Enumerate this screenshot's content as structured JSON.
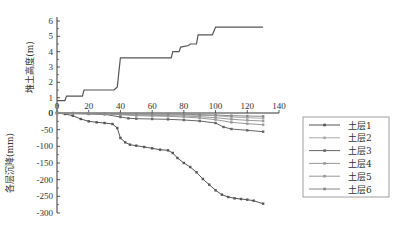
{
  "chart_data": [
    {
      "type": "line",
      "title": "",
      "xlabel": "",
      "ylabel": "堆土高度(m)",
      "xlim": [
        0,
        140
      ],
      "ylim": [
        0,
        6
      ],
      "xticks": [
        0,
        20,
        40,
        60,
        80,
        100,
        120,
        140
      ],
      "yticks": [
        0,
        1,
        2,
        3,
        4,
        5,
        6
      ],
      "series": [
        {
          "name": "堆土高度",
          "x": [
            0,
            5,
            6,
            16,
            17,
            36,
            38,
            40,
            72,
            73,
            77,
            78,
            83,
            84,
            88,
            89,
            98,
            100,
            130
          ],
          "y": [
            0.8,
            0.8,
            1.1,
            1.1,
            1.5,
            1.5,
            1.7,
            3.6,
            3.6,
            4.0,
            4.0,
            4.3,
            4.4,
            4.5,
            4.5,
            5.1,
            5.1,
            5.6,
            5.6
          ]
        }
      ]
    },
    {
      "type": "line",
      "title": "",
      "xlabel": "",
      "ylabel": "各层沉降(mm)",
      "xlim": [
        0,
        140
      ],
      "ylim": [
        -300,
        0
      ],
      "yticks": [
        0,
        -50,
        -100,
        -150,
        -200,
        -250,
        -300
      ],
      "legend_position": "right",
      "series": [
        {
          "name": "土层1",
          "x": [
            0,
            5,
            10,
            15,
            20,
            25,
            30,
            35,
            38,
            40,
            43,
            46,
            50,
            55,
            60,
            65,
            70,
            73,
            76,
            80,
            84,
            88,
            92,
            96,
            100,
            104,
            108,
            112,
            116,
            120,
            124,
            130
          ],
          "y": [
            0,
            -3,
            -8,
            -18,
            -25,
            -28,
            -30,
            -33,
            -45,
            -75,
            -88,
            -95,
            -98,
            -102,
            -106,
            -110,
            -112,
            -120,
            -135,
            -150,
            -162,
            -178,
            -198,
            -215,
            -232,
            -245,
            -252,
            -256,
            -258,
            -260,
            -263,
            -272
          ]
        },
        {
          "name": "土层2",
          "x": [
            0,
            10,
            20,
            30,
            40,
            50,
            60,
            70,
            80,
            90,
            100,
            110,
            120,
            130
          ],
          "y": [
            0,
            -1,
            -2,
            -3,
            -4,
            -4,
            -5,
            -5,
            -6,
            -7,
            -8,
            -12,
            -14,
            -16
          ]
        },
        {
          "name": "土层3",
          "x": [
            0,
            10,
            20,
            30,
            40,
            45,
            50,
            60,
            70,
            80,
            90,
            100,
            105,
            110,
            120,
            130
          ],
          "y": [
            0,
            -2,
            -3,
            -4,
            -12,
            -16,
            -17,
            -18,
            -19,
            -21,
            -24,
            -30,
            -42,
            -48,
            -52,
            -56
          ]
        },
        {
          "name": "土层4",
          "x": [
            0,
            10,
            20,
            30,
            40,
            50,
            60,
            70,
            80,
            90,
            100,
            110,
            120,
            130
          ],
          "y": [
            0,
            -1,
            -1,
            -2,
            -5,
            -8,
            -9,
            -10,
            -12,
            -15,
            -20,
            -28,
            -32,
            -35
          ]
        },
        {
          "name": "土层5",
          "x": [
            0,
            10,
            20,
            30,
            40,
            50,
            60,
            70,
            80,
            90,
            100,
            110,
            120,
            130
          ],
          "y": [
            0,
            -1,
            -1,
            -2,
            -4,
            -6,
            -7,
            -8,
            -9,
            -11,
            -14,
            -19,
            -22,
            -24
          ]
        },
        {
          "name": "土层6",
          "x": [
            0,
            10,
            20,
            30,
            40,
            50,
            60,
            70,
            80,
            90,
            100,
            110,
            120,
            130
          ],
          "y": [
            0,
            0,
            -1,
            -1,
            -2,
            -2,
            -3,
            -3,
            -4,
            -5,
            -6,
            -8,
            -9,
            -10
          ]
        }
      ]
    }
  ],
  "colors": {
    "axis": "#333333",
    "line": "#555555",
    "series": [
      "#555555",
      "#aaaaaa",
      "#666666",
      "#999999",
      "#999999",
      "#888888"
    ]
  }
}
